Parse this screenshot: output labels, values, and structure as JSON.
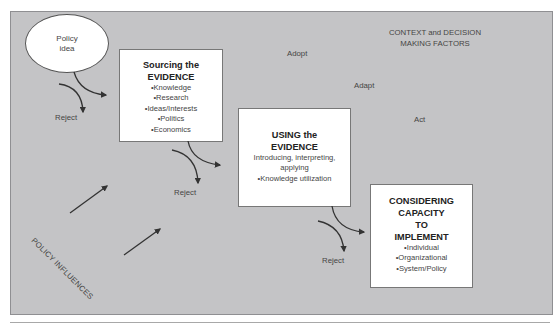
{
  "diagram": {
    "context_label": "CONTEXT and DECISION MAKING FACTORS",
    "start_node": {
      "label_line1": "Policy",
      "label_line2": "idea"
    },
    "stages": [
      {
        "title_line1": "Sourcing the",
        "title_line2": "EVIDENCE",
        "description": "",
        "items": [
          "Knowledge",
          "Research",
          "Ideas/Interests",
          "Politics",
          "Economics"
        ]
      },
      {
        "title_line1": "USING the",
        "title_line2": "EVIDENCE",
        "description_line1": "Introducing, interpreting,",
        "description_line2": "applying",
        "items": [
          "Knowledge utilization"
        ]
      },
      {
        "title_line1": "CONSIDERING",
        "title_line2": "CAPACITY",
        "title_line3": "TO",
        "title_line4": "IMPLEMENT",
        "items": [
          "Individual",
          "Organizational",
          "System/Policy"
        ]
      }
    ],
    "outcomes": {
      "adopt": "Adopt",
      "adapt": "Adapt",
      "act": "Act"
    },
    "reject_labels": [
      "Reject",
      "Reject",
      "Reject"
    ],
    "influences_label": "POLICY INFLUENCES",
    "colors": {
      "panel_background": "#c4c4c6",
      "box_background": "#ffffff",
      "arrow": "#333333",
      "text": "#444444"
    }
  }
}
